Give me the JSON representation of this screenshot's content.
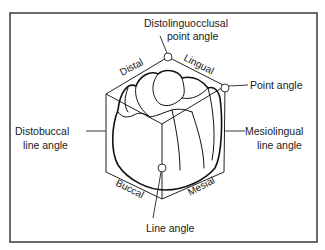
{
  "figure": {
    "type": "anatomical diagram"
  },
  "face_labels": {
    "distal": "Distal",
    "lingual": "Lingual",
    "buccal": "Buccal",
    "mesial": "Mesial"
  },
  "callouts": {
    "distolinguocclusal": {
      "line1": "Distolinguocclusal",
      "line2": "point angle"
    },
    "point_angle": {
      "line1": "Point angle"
    },
    "mesiolingual": {
      "line1": "Mesiolingual",
      "line2": "line angle"
    },
    "distobuccal": {
      "line1": "Distobuccal",
      "line2": "line angle"
    },
    "line_angle": {
      "line1": "Line angle"
    }
  },
  "colors": {
    "ink": "#1a1a1a",
    "frame": "#3a3a3a",
    "background": "#ffffff"
  }
}
